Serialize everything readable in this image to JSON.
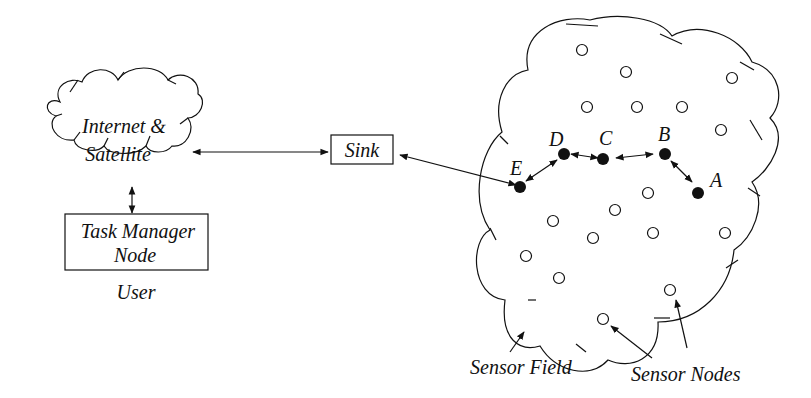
{
  "diagram": {
    "internet_cloud": {
      "line1": "Internet &",
      "line2": "Satellite"
    },
    "sink": {
      "label": "Sink"
    },
    "task_manager": {
      "line1": "Task Manager",
      "line2": "Node"
    },
    "user_label": "User",
    "sensor_field_label": "Sensor Field",
    "sensor_nodes_label": "Sensor Nodes",
    "path_nodes": [
      {
        "id": "A",
        "label": "A"
      },
      {
        "id": "B",
        "label": "B"
      },
      {
        "id": "C",
        "label": "C"
      },
      {
        "id": "D",
        "label": "D"
      },
      {
        "id": "E",
        "label": "E"
      }
    ],
    "colors": {
      "stroke": "#111111",
      "background": "#ffffff"
    }
  }
}
